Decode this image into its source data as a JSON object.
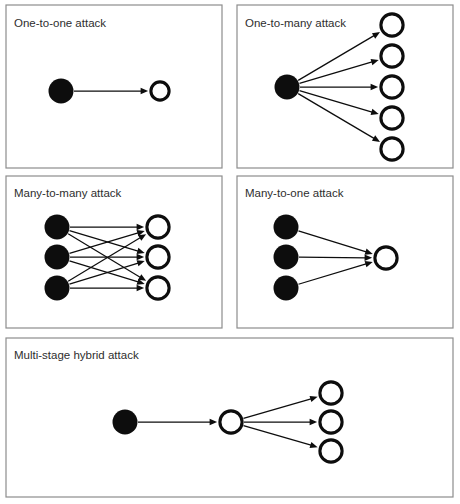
{
  "figure": {
    "background_color": "#ffffff",
    "panel_border_color": "#8d8d8d",
    "node_filled_color": "#0d0d0d",
    "node_hollow_fill": "#ffffff",
    "node_hollow_stroke": "#0d0d0d",
    "edge_color": "#0d0d0d"
  },
  "panels": [
    {
      "id": "one-to-one",
      "label": "One-to-one attack",
      "box": {
        "x": 6,
        "y": 5,
        "w": 216,
        "h": 163
      },
      "label_pos": {
        "x": 14,
        "y": 24
      },
      "attackers": [
        {
          "cx": 61,
          "cy": 91,
          "r": 12.5
        }
      ],
      "victims": [
        {
          "cx": 160,
          "cy": 91,
          "r": 10.5
        }
      ],
      "edges": [
        {
          "from": 0,
          "to": 0
        }
      ],
      "edge_count": 1
    },
    {
      "id": "one-to-many",
      "label": "One-to-many attack",
      "box": {
        "x": 237,
        "y": 5,
        "w": 216,
        "h": 163
      },
      "label_pos": {
        "x": 245,
        "y": 24
      },
      "attackers": [
        {
          "cx": 287,
          "cy": 87,
          "r": 12.5
        }
      ],
      "victims": [
        {
          "cx": 392,
          "cy": 25,
          "r": 12.5
        },
        {
          "cx": 392,
          "cy": 56,
          "r": 12.5
        },
        {
          "cx": 392,
          "cy": 87,
          "r": 12.5
        },
        {
          "cx": 392,
          "cy": 118,
          "r": 12.5
        },
        {
          "cx": 392,
          "cy": 149,
          "r": 12.5
        }
      ],
      "edges": [
        {
          "from": 0,
          "to": 0
        },
        {
          "from": 0,
          "to": 1
        },
        {
          "from": 0,
          "to": 2
        },
        {
          "from": 0,
          "to": 3
        },
        {
          "from": 0,
          "to": 4
        }
      ],
      "edge_count": 5
    },
    {
      "id": "many-to-many",
      "label": "Many-to-many attack",
      "box": {
        "x": 6,
        "y": 176,
        "w": 216,
        "h": 152
      },
      "label_pos": {
        "x": 14,
        "y": 194
      },
      "attackers": [
        {
          "cx": 57,
          "cy": 227,
          "r": 12.5
        },
        {
          "cx": 57,
          "cy": 257,
          "r": 12.5
        },
        {
          "cx": 57,
          "cy": 288,
          "r": 12.5
        }
      ],
      "victims": [
        {
          "cx": 158,
          "cy": 227,
          "r": 12.5
        },
        {
          "cx": 158,
          "cy": 257,
          "r": 12.5
        },
        {
          "cx": 158,
          "cy": 288,
          "r": 12.5
        }
      ],
      "edges": [
        {
          "from": 0,
          "to": 0
        },
        {
          "from": 0,
          "to": 1
        },
        {
          "from": 0,
          "to": 2
        },
        {
          "from": 1,
          "to": 0
        },
        {
          "from": 1,
          "to": 1
        },
        {
          "from": 1,
          "to": 2
        },
        {
          "from": 2,
          "to": 0
        },
        {
          "from": 2,
          "to": 1
        },
        {
          "from": 2,
          "to": 2
        }
      ],
      "edge_count": 9
    },
    {
      "id": "many-to-one",
      "label": "Many-to-one attack",
      "box": {
        "x": 237,
        "y": 176,
        "w": 216,
        "h": 152
      },
      "label_pos": {
        "x": 245,
        "y": 194
      },
      "attackers": [
        {
          "cx": 286,
          "cy": 227,
          "r": 12.5
        },
        {
          "cx": 286,
          "cy": 257,
          "r": 12.5
        },
        {
          "cx": 286,
          "cy": 288,
          "r": 12.5
        }
      ],
      "victims": [
        {
          "cx": 386,
          "cy": 258,
          "r": 12.5
        }
      ],
      "edges": [
        {
          "from": 0,
          "to": 0
        },
        {
          "from": 1,
          "to": 0
        },
        {
          "from": 2,
          "to": 0
        }
      ],
      "edge_count": 3
    }
  ],
  "multi_stage_panel": {
    "id": "multi-stage-hybrid",
    "label": "Multi-stage hybrid attack",
    "box": {
      "x": 6,
      "y": 338,
      "w": 447,
      "h": 159
    },
    "label_pos": {
      "x": 14,
      "y": 356
    },
    "attacker": {
      "cx": 125,
      "cy": 422,
      "r": 12.5
    },
    "relay": {
      "cx": 231,
      "cy": 422,
      "r": 12.5
    },
    "victims": [
      {
        "cx": 331,
        "cy": 393,
        "r": 12.5
      },
      {
        "cx": 331,
        "cy": 422,
        "r": 12.5
      },
      {
        "cx": 331,
        "cy": 451,
        "r": 12.5
      }
    ],
    "stage_one_edge_count": 1,
    "stage_two_edge_count": 3
  },
  "legend": {
    "filled_node_meaning": "attacker",
    "hollow_node_meaning": "victim",
    "edge_meaning": "attack direction"
  }
}
